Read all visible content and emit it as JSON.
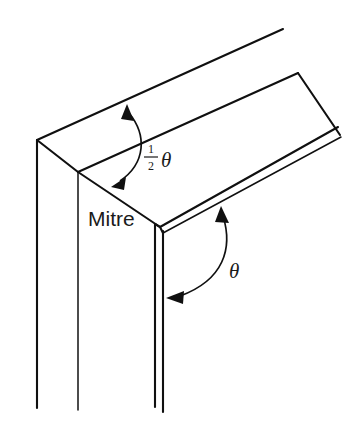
{
  "figure": {
    "kind": "technical-line-drawing",
    "background_color": "#ffffff",
    "line_color": "#101010"
  },
  "labels": {
    "mitre": "Mitre",
    "half_angle": {
      "numerator": "1",
      "denominator": "2",
      "symbol": "θ"
    },
    "full_angle": {
      "symbol": "θ"
    }
  },
  "annotations": {
    "half_angle_arc": {
      "name": "half-angle-arc",
      "description": "double-headed arc between top edge and mitre line"
    },
    "full_angle_arc": {
      "name": "full-angle-arc",
      "description": "double-headed arc between right arm top edge and vertical front edge"
    }
  }
}
